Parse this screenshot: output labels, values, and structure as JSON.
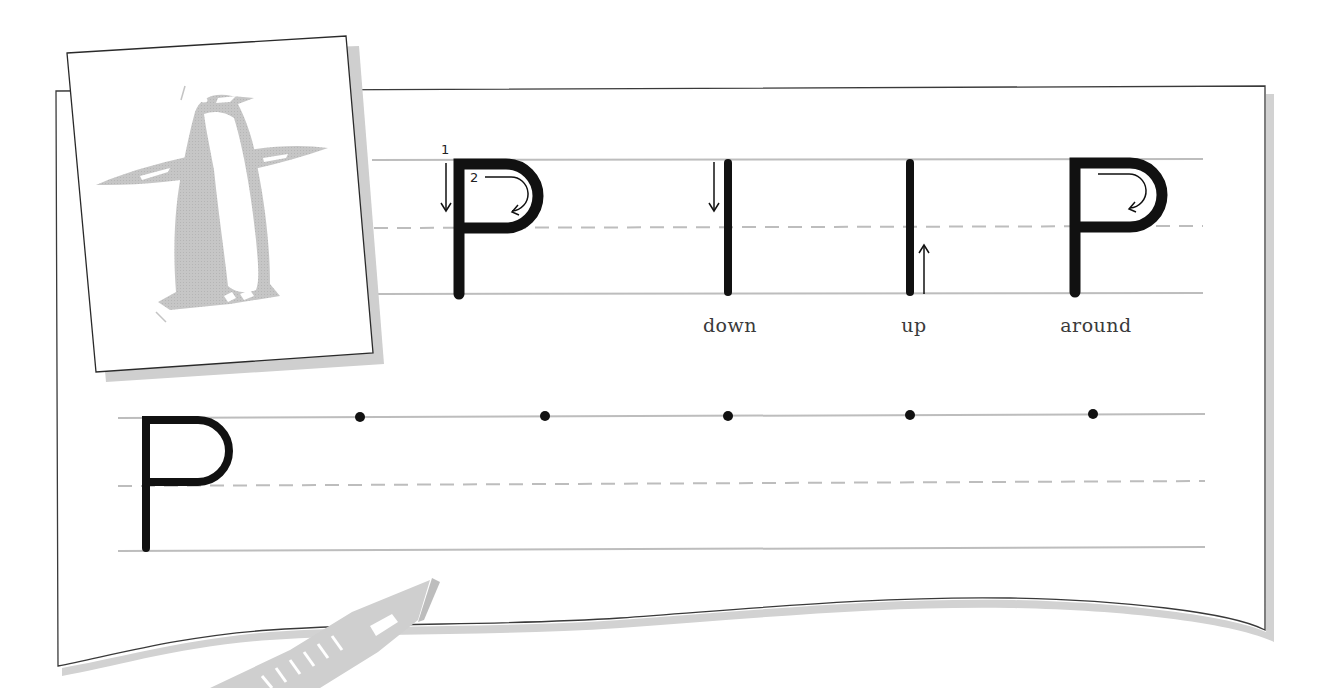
{
  "worksheet": {
    "letter": "P",
    "picture": "penguin-illustration",
    "stroke_numbers": [
      "1",
      "2"
    ],
    "stroke_labels": {
      "down": "down",
      "up": "up",
      "around": "around"
    },
    "practice_dots": 5
  },
  "colors": {
    "ink": "#111111",
    "guide_line": "#bdbdbd",
    "dashed_line": "#bdbdbd",
    "paper_border": "#3a3a3a",
    "shadow": "#cfcfcf",
    "illustration": "#c4c4c4",
    "label_text": "#3a3a3a"
  }
}
